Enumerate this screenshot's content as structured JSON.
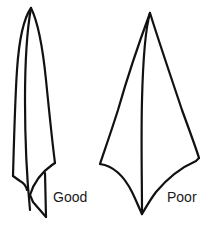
{
  "diagram": {
    "figures": [
      {
        "id": "good",
        "label": "Good",
        "description": "Narrow, long folded point with overlapping flap"
      },
      {
        "id": "poor",
        "label": "Poor",
        "description": "Wide, kite-shaped folded point"
      }
    ],
    "colors": {
      "stroke": "#111111",
      "background": "#ffffff",
      "text": "#1a1a1a"
    }
  }
}
